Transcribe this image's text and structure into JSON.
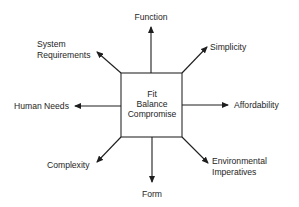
{
  "diagram": {
    "type": "radial-concept-map",
    "center": {
      "lines": [
        "Fit",
        "Balance",
        "Compromise"
      ]
    },
    "nodes": {
      "top": {
        "label": "Function"
      },
      "top_right": {
        "label": "Simplicity"
      },
      "right": {
        "label": "Affordability"
      },
      "bottom_right": {
        "lines": [
          "Environmental",
          "Imperatives"
        ]
      },
      "bottom": {
        "label": "Form"
      },
      "bottom_left": {
        "label": "Complexity"
      },
      "left": {
        "label": "Human Needs"
      },
      "top_left": {
        "lines": [
          "System",
          "Requirements"
        ]
      }
    },
    "colors": {
      "line": "#1e1e1e",
      "text": "#1e1e1e",
      "background": "#ffffff"
    }
  }
}
